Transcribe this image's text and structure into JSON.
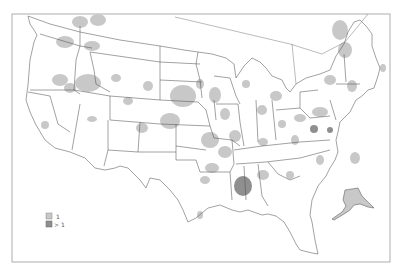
{
  "map": {
    "region": "Contiguous United States with Alaska inset",
    "legend": {
      "items": [
        {
          "label": "1",
          "color": "#c8c8c8"
        },
        {
          "label": "> 1",
          "color": "#8f8f8f"
        }
      ]
    },
    "colors": {
      "level_1": "#c8c8c8",
      "level_gt1": "#8f8f8f",
      "borders": "#555555",
      "background": "#ffffff"
    }
  }
}
